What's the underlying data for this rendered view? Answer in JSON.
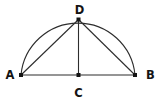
{
  "figure": {
    "background_color": "#ffffff",
    "line_color": "#2d2d2d",
    "point_color": "#141414",
    "label_color": "#141414",
    "points": [
      {
        "name": "A",
        "x": 21,
        "y": 75,
        "label_x": 10,
        "label_y": 79
      },
      {
        "name": "B",
        "x": 135,
        "y": 75,
        "label_x": 150.5,
        "label_y": 79
      },
      {
        "name": "C",
        "x": 78.5,
        "y": 75,
        "label_x": 78.5,
        "label_y": 97
      },
      {
        "name": "D",
        "x": 78.5,
        "y": 19.5,
        "label_x": 79.5,
        "label_y": 13.5
      }
    ],
    "segments": [
      {
        "from": "A",
        "to": "B"
      },
      {
        "from": "A",
        "to": "D"
      },
      {
        "from": "D",
        "to": "B"
      },
      {
        "from": "D",
        "to": "C"
      }
    ],
    "arc": {
      "from": "A",
      "to": "B",
      "radius": 57.25
    },
    "point_marker_size": 4,
    "stroke_width": 1.1
  }
}
